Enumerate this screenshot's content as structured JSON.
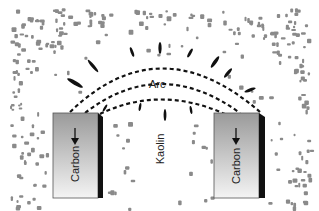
{
  "diagram": {
    "labels": {
      "arc": "Arc",
      "kaolin": "Kaolin",
      "carbon_left": "Carbon",
      "carbon_right": "Carbon"
    },
    "colors": {
      "particles": "#8a8a8a",
      "electrode_face_top": "#9a9a9a",
      "electrode_face_bottom": "#f2f2f2",
      "electrode_side": "#111111",
      "arc_lines": "#111111",
      "rays": "#111111"
    }
  }
}
